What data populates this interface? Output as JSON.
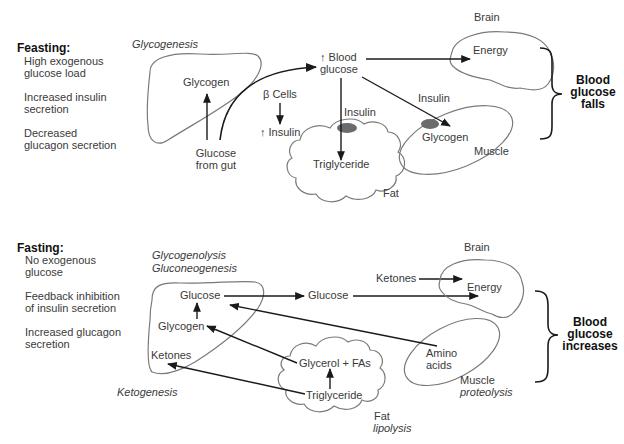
{
  "feasting": {
    "title": "Feasting:",
    "conditions": [
      "High exogenous",
      "glucose load",
      "Increased insulin",
      "secretion",
      "Decreased",
      "glucagon secretion"
    ],
    "process_label": "Glycogenesis",
    "liver_glycogen": "Glycogen",
    "glucose_from_gut_1": "Glucose",
    "glucose_from_gut_2": "from gut",
    "beta_cells": "β Cells",
    "up_insulin": "↑ Insulin",
    "blood_glucose_1": "↑ Blood",
    "blood_glucose_2": "glucose",
    "brain_label": "Brain",
    "brain_energy": "Energy",
    "insulin_fat": "Insulin",
    "insulin_muscle": "Insulin",
    "fat_triglyceride": "Triglyceride",
    "fat_label": "Fat",
    "muscle_glycogen": "Glycogen",
    "muscle_label": "Muscle",
    "outcome_1": "Blood",
    "outcome_2": "glucose",
    "outcome_3": "falls"
  },
  "fasting": {
    "title": "Fasting:",
    "conditions": [
      "No exogenous",
      "glucose",
      "Feedback inhibition",
      "of insulin secretion",
      "Increased glucagon",
      "secretion"
    ],
    "process_label_1": "Glycogenolysis",
    "process_label_2": "Gluconeogenesis",
    "liver_glucose": "Glucose",
    "liver_glycogen": "Glycogen",
    "liver_ketones": "Ketones",
    "ketogenesis": "Ketogenesis",
    "blood_glucose": "Glucose",
    "ketones": "Ketones",
    "brain_label": "Brain",
    "brain_energy": "Energy",
    "fat_glycerol": "Glycerol + FAs",
    "fat_triglyceride": "Triglyceride",
    "fat_label": "Fat",
    "fat_process": "lipolysis",
    "muscle_amino_1": "Amino",
    "muscle_amino_2": "acids",
    "muscle_label": "Muscle",
    "muscle_process": "proteolysis",
    "outcome_1": "Blood",
    "outcome_2": "glucose",
    "outcome_3": "increases"
  },
  "colors": {
    "organ_outline": "#7a7a7a",
    "arrow": "#1a1a1a",
    "receptor": "#6b6b6b"
  }
}
